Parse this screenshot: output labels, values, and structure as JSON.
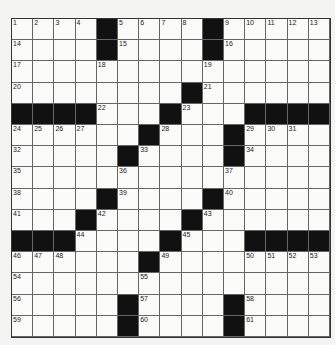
{
  "puzzle": {
    "size": 15,
    "grid": [
      [
        "1",
        "2",
        "3",
        "4",
        "#",
        "5",
        "6",
        "7",
        "8",
        "#",
        "9",
        "10",
        "11",
        "12",
        "13"
      ],
      [
        "14",
        "",
        "",
        "",
        "#",
        "15",
        "",
        "",
        "",
        "#",
        "16",
        "",
        "",
        "",
        ""
      ],
      [
        "17",
        "",
        "",
        "",
        "18",
        "",
        "",
        "",
        "",
        "19",
        "",
        "",
        "",
        "",
        ""
      ],
      [
        "20",
        "",
        "",
        "",
        "",
        "",
        "",
        "",
        "#",
        "21",
        "",
        "",
        "",
        "",
        ""
      ],
      [
        "#",
        "#",
        "#",
        "#",
        "22",
        "",
        "",
        "#",
        "23",
        "",
        "",
        "#",
        "#",
        "#",
        "#"
      ],
      [
        "24",
        "25",
        "26",
        "27",
        "",
        "",
        "#",
        "28",
        "",
        "",
        "#",
        "29",
        "30",
        "31",
        ""
      ],
      [
        "32",
        "",
        "",
        "",
        "",
        "#",
        "33",
        "",
        "",
        "",
        "#",
        "34",
        "",
        "",
        ""
      ],
      [
        "35",
        "",
        "",
        "",
        "",
        "36",
        "",
        "",
        "",
        "",
        "37",
        "",
        "",
        "",
        ""
      ],
      [
        "38",
        "",
        "",
        "",
        "#",
        "39",
        "",
        "",
        "",
        "#",
        "40",
        "",
        "",
        "",
        ""
      ],
      [
        "41",
        "",
        "",
        "#",
        "42",
        "",
        "",
        "",
        "#",
        "43",
        "",
        "",
        "",
        "",
        ""
      ],
      [
        "#",
        "#",
        "#",
        "44",
        "",
        "",
        "",
        "#",
        "45",
        "",
        "",
        "#",
        "#",
        "#",
        "#"
      ],
      [
        "46",
        "47",
        "48",
        "",
        "",
        "",
        "#",
        "49",
        "",
        "",
        "",
        "50",
        "51",
        "52",
        "53"
      ],
      [
        "54",
        "",
        "",
        "",
        "",
        "",
        "55",
        "",
        "",
        "",
        "",
        "",
        "",
        "",
        ""
      ],
      [
        "56",
        "",
        "",
        "",
        "",
        "#",
        "57",
        "",
        "",
        "",
        "#",
        "58",
        "",
        "",
        ""
      ],
      [
        "59",
        "",
        "",
        "",
        "",
        "#",
        "60",
        "",
        "",
        "",
        "#",
        "61",
        "",
        "",
        ""
      ]
    ]
  }
}
